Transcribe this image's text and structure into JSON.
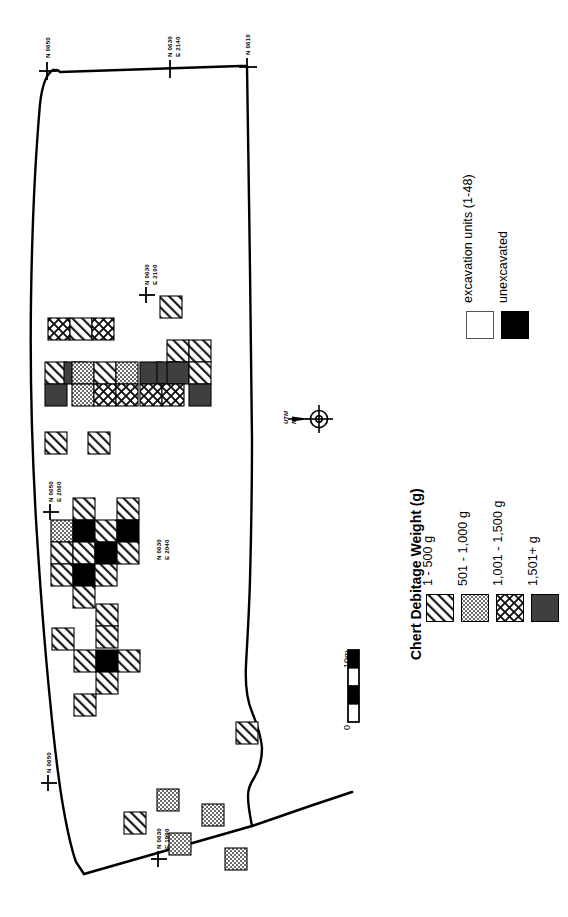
{
  "figure": {
    "kind": "archaeological-site-distribution-map",
    "orientation": "rotated-90-ccw"
  },
  "legend_main": {
    "title": "Chert Debitage Weight (g)",
    "entries": [
      {
        "label": "1 - 500 g",
        "pattern": "diagonal-hatch"
      },
      {
        "label": "501 - 1,000 g",
        "pattern": "dense-stipple"
      },
      {
        "label": "1,001 - 1,500 g",
        "pattern": "diamond-crosshatch"
      },
      {
        "label": "1,501+ g",
        "pattern": "solid-dark-gray"
      }
    ]
  },
  "legend_units": {
    "entries": [
      {
        "label": "excavation units (1-48)",
        "pattern": "open-white"
      },
      {
        "label": "unexcavated",
        "pattern": "solid-black"
      }
    ]
  },
  "scale_bar": {
    "min_label": "0",
    "max_label": "10m",
    "segments": 4
  },
  "north_arrow": {
    "line1": "UTM",
    "line2": "N"
  },
  "coordinates": [
    {
      "id": "c1",
      "lines": "N 0650"
    },
    {
      "id": "c2",
      "lines": "N 0630\nE 2140"
    },
    {
      "id": "c3",
      "lines": "N 0610"
    },
    {
      "id": "c4",
      "lines": "N 0630\nE 2100"
    },
    {
      "id": "c5",
      "lines": "N 0650\nE 2060"
    },
    {
      "id": "c6",
      "lines": "N 0630\nE 2040"
    },
    {
      "id": "c7",
      "lines": "N 0650"
    },
    {
      "id": "c8",
      "lines": "N 0630\nE 1990"
    }
  ],
  "colors": {
    "ink": "#000000",
    "dark_gray": "#3f3f3f",
    "stipple_gray": "#8a8a8a",
    "boundary": "#000000"
  },
  "chart_data": {
    "type": "heatmap",
    "title": "Chert Debitage Weight (g)",
    "xlabel": "Easting (m)",
    "ylabel": "Northing (m)",
    "grid": false,
    "legend_position": "right",
    "categories": [
      "1 - 500 g",
      "501 - 1,000 g",
      "1,001 - 1,500 g",
      "1,501+ g",
      "unexcavated"
    ],
    "cell_size_px": 22,
    "cells": [
      {
        "x": 160,
        "y": 296,
        "cat": "1 - 500 g"
      },
      {
        "x": 48,
        "y": 318,
        "cat": "1,001 - 1,500 g"
      },
      {
        "x": 70,
        "y": 318,
        "cat": "1 - 500 g"
      },
      {
        "x": 92,
        "y": 318,
        "cat": "1,001 - 1,500 g"
      },
      {
        "x": 167,
        "y": 340,
        "cat": "1 - 500 g"
      },
      {
        "x": 189,
        "y": 340,
        "cat": "1 - 500 g"
      },
      {
        "x": 45,
        "y": 362,
        "cat": "1 - 500 g"
      },
      {
        "x": 64,
        "y": 362,
        "cat": "1,501+ g"
      },
      {
        "x": 72,
        "y": 362,
        "cat": "501 - 1,000 g"
      },
      {
        "x": 94,
        "y": 362,
        "cat": "1 - 500 g"
      },
      {
        "x": 116,
        "y": 362,
        "cat": "501 - 1,000 g"
      },
      {
        "x": 140,
        "y": 362,
        "cat": "1,501+ g"
      },
      {
        "x": 157,
        "y": 362,
        "cat": "1,501+ g"
      },
      {
        "x": 167,
        "y": 362,
        "cat": "1,501+ g"
      },
      {
        "x": 189,
        "y": 362,
        "cat": "1 - 500 g"
      },
      {
        "x": 45,
        "y": 384,
        "cat": "1,501+ g"
      },
      {
        "x": 72,
        "y": 384,
        "cat": "501 - 1,000 g"
      },
      {
        "x": 94,
        "y": 384,
        "cat": "1,001 - 1,500 g"
      },
      {
        "x": 116,
        "y": 384,
        "cat": "1,001 - 1,500 g"
      },
      {
        "x": 140,
        "y": 384,
        "cat": "1,001 - 1,500 g"
      },
      {
        "x": 162,
        "y": 384,
        "cat": "1,001 - 1,500 g"
      },
      {
        "x": 189,
        "y": 384,
        "cat": "1,501+ g"
      },
      {
        "x": 45,
        "y": 432,
        "cat": "1 - 500 g"
      },
      {
        "x": 88,
        "y": 432,
        "cat": "1 - 500 g"
      },
      {
        "x": 73,
        "y": 498,
        "cat": "1 - 500 g"
      },
      {
        "x": 117,
        "y": 498,
        "cat": "1 - 500 g"
      },
      {
        "x": 51,
        "y": 520,
        "cat": "501 - 1,000 g"
      },
      {
        "x": 73,
        "y": 520,
        "cat": "unexcavated"
      },
      {
        "x": 95,
        "y": 520,
        "cat": "1 - 500 g"
      },
      {
        "x": 117,
        "y": 520,
        "cat": "unexcavated"
      },
      {
        "x": 51,
        "y": 542,
        "cat": "1 - 500 g"
      },
      {
        "x": 73,
        "y": 542,
        "cat": "1 - 500 g"
      },
      {
        "x": 95,
        "y": 542,
        "cat": "unexcavated"
      },
      {
        "x": 117,
        "y": 542,
        "cat": "1 - 500 g"
      },
      {
        "x": 51,
        "y": 564,
        "cat": "1 - 500 g"
      },
      {
        "x": 73,
        "y": 564,
        "cat": "unexcavated"
      },
      {
        "x": 95,
        "y": 564,
        "cat": "1 - 500 g"
      },
      {
        "x": 73,
        "y": 586,
        "cat": "1 - 500 g"
      },
      {
        "x": 96,
        "y": 604,
        "cat": "1 - 500 g"
      },
      {
        "x": 96,
        "y": 626,
        "cat": "1 - 500 g"
      },
      {
        "x": 52,
        "y": 628,
        "cat": "1 - 500 g"
      },
      {
        "x": 74,
        "y": 650,
        "cat": "1 - 500 g"
      },
      {
        "x": 96,
        "y": 650,
        "cat": "unexcavated"
      },
      {
        "x": 118,
        "y": 650,
        "cat": "1 - 500 g"
      },
      {
        "x": 96,
        "y": 672,
        "cat": "1 - 500 g"
      },
      {
        "x": 74,
        "y": 694,
        "cat": "1 - 500 g"
      },
      {
        "x": 236,
        "y": 722,
        "cat": "1 - 500 g"
      },
      {
        "x": 157,
        "y": 789,
        "cat": "501 - 1,000 g"
      },
      {
        "x": 124,
        "y": 812,
        "cat": "1 - 500 g"
      },
      {
        "x": 202,
        "y": 804,
        "cat": "501 - 1,000 g"
      },
      {
        "x": 169,
        "y": 833,
        "cat": "501 - 1,000 g"
      },
      {
        "x": 225,
        "y": 848,
        "cat": "501 - 1,000 g"
      }
    ]
  }
}
